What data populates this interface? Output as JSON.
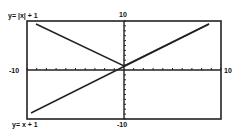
{
  "chart_data": {
    "type": "line",
    "title": "",
    "window": {
      "xmin": -10,
      "xmax": 10,
      "ymin": -10,
      "ymax": 10
    },
    "xlim": [
      -10,
      10
    ],
    "ylim": [
      -10,
      10
    ],
    "tick_spacing": 1,
    "grid": false,
    "axis_labels": {
      "top": "10",
      "bottom": "-10",
      "left": "-10",
      "right": "10"
    },
    "series": [
      {
        "name": "y= |x| + 1",
        "equation": "y = |x| + 1",
        "points": [
          [
            -10,
            11
          ],
          [
            -9,
            10
          ],
          [
            0,
            1
          ],
          [
            9,
            10
          ],
          [
            10,
            11
          ]
        ]
      },
      {
        "name": "y= x + 1",
        "equation": "y = x + 1",
        "points": [
          [
            -10,
            -9
          ],
          [
            0,
            1
          ],
          [
            9,
            10
          ],
          [
            10,
            11
          ]
        ]
      }
    ],
    "annotations": [
      {
        "text": "y= |x| + 1",
        "position": "top-left"
      },
      {
        "text": "y= x + 1",
        "position": "bottom-left"
      }
    ],
    "legend": null
  },
  "labels": {
    "eq_abs": "y= |x| + 1",
    "eq_lin": "y= x + 1",
    "y_max": "10",
    "y_min": "-10",
    "x_min": "-10",
    "x_max": "10"
  }
}
